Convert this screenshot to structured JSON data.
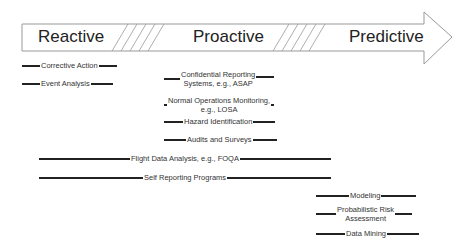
{
  "arrow": {
    "phases": [
      {
        "id": "reactive",
        "label": "Reactive"
      },
      {
        "id": "proactive",
        "label": "Proactive"
      },
      {
        "id": "predictive",
        "label": "Predictive"
      }
    ],
    "stroke_color": "#888888"
  },
  "items": [
    {
      "label": "Corrective Action",
      "phase_span": "Reactive"
    },
    {
      "label": "Event Analysis",
      "phase_span": "Reactive"
    },
    {
      "label_line1": "Confidential Reporting",
      "label_line2": "Systems, e.g., ASAP",
      "phase_span": "Proactive"
    },
    {
      "label_line1": "Normal Operations Monitoring,",
      "label_line2": "e.g., LOSA",
      "phase_span": "Proactive"
    },
    {
      "label": "Hazard Identification",
      "phase_span": "Proactive"
    },
    {
      "label": "Audits and Surveys",
      "phase_span": "Proactive"
    },
    {
      "label": "Flight Data Analysis, e.g., FOQA",
      "phase_span": "Reactive to Proactive"
    },
    {
      "label": "Self Reporting Programs",
      "phase_span": "Reactive to Proactive"
    },
    {
      "label": "Modeling",
      "phase_span": "Predictive"
    },
    {
      "label_line1": "Probabilistic Risk",
      "label_line2": "Assessment",
      "phase_span": "Predictive"
    },
    {
      "label": "Data Mining",
      "phase_span": "Predictive"
    }
  ]
}
